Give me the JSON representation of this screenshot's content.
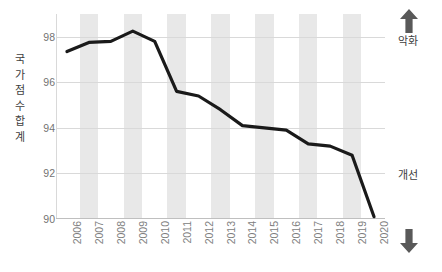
{
  "chart_data": {
    "type": "line",
    "title": "",
    "xlabel": "",
    "ylabel": "국가점수합계",
    "categories": [
      "2006",
      "2007",
      "2008",
      "2009",
      "2010",
      "2011",
      "2012",
      "2013",
      "2014",
      "2015",
      "2016",
      "2017",
      "2018",
      "2019",
      "2020"
    ],
    "values": [
      97.35,
      97.75,
      97.8,
      98.25,
      97.8,
      95.6,
      95.4,
      94.8,
      94.1,
      94.0,
      93.9,
      93.3,
      93.2,
      92.8,
      90.1
    ],
    "series": [
      {
        "name": "국가점수합계",
        "values": [
          97.35,
          97.75,
          97.8,
          98.25,
          97.8,
          95.6,
          95.4,
          94.8,
          94.1,
          94.0,
          93.9,
          93.3,
          93.2,
          92.8,
          90.1
        ]
      }
    ],
    "ylim": [
      90,
      99
    ],
    "yticks": [
      90,
      92,
      94,
      96,
      98
    ],
    "ytick_labels": [
      "90",
      "92",
      "94",
      "96",
      "98"
    ],
    "grid": true,
    "legend": false,
    "legend_position": "none",
    "line_color": "#1a1a1a",
    "band_color": "#e8e8e8",
    "banded_categories": [
      "2007",
      "2009",
      "2011",
      "2013",
      "2015",
      "2017",
      "2019"
    ],
    "annotations": [
      {
        "name": "worsening",
        "text": "악화",
        "icon": "arrow-up-icon",
        "position": "top-right"
      },
      {
        "name": "improving",
        "text": "개선",
        "icon": "arrow-down-icon",
        "position": "bottom-right"
      }
    ]
  },
  "y_axis": {
    "title_chars": [
      "국",
      "가",
      "점",
      "수",
      "합",
      "계"
    ]
  },
  "right_panel": {
    "top_label": "악화",
    "top_icon": "arrow-up-icon",
    "bottom_label": "개선",
    "bottom_icon": "arrow-down-icon"
  },
  "colors": {
    "line": "#1a1a1a",
    "band": "#e8e8e8",
    "grid": "#d9d9d9",
    "axis": "#bfbfbf",
    "tick_text": "#737373",
    "label_text": "#404040",
    "arrow": "#595959",
    "background": "#ffffff"
  }
}
